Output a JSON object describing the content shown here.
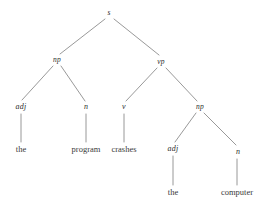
{
  "figure": {
    "kind": "constituency-syntax-tree",
    "sentence": "the program crashes the computer",
    "background_color": "#ffffff",
    "edge_color": "#8d8d8d",
    "label_color": "#2b2b2b",
    "leaf_color": "#3a3a3a"
  },
  "nodes": {
    "root": {
      "label": "s",
      "x": 109,
      "y": 13
    },
    "np_subject": {
      "label": "np",
      "x": 57,
      "y": 60
    },
    "vp": {
      "label": "vp",
      "x": 161,
      "y": 62
    },
    "adj_subject": {
      "label": "adj",
      "x": 21,
      "y": 107
    },
    "n_subject": {
      "label": "n",
      "x": 86,
      "y": 107
    },
    "v": {
      "label": "v",
      "x": 124,
      "y": 107
    },
    "np_object": {
      "label": "np",
      "x": 200,
      "y": 107
    },
    "adj_object": {
      "label": "adj",
      "x": 173,
      "y": 149
    },
    "n_object": {
      "label": "n",
      "x": 238,
      "y": 152
    }
  },
  "leaves": {
    "the_subject": {
      "word": "the",
      "x": 21,
      "y": 149
    },
    "program": {
      "word": "program",
      "x": 86,
      "y": 149
    },
    "crashes": {
      "word": "crashes",
      "x": 124,
      "y": 149
    },
    "the_object": {
      "word": "the",
      "x": 173,
      "y": 192
    },
    "computer": {
      "word": "computer",
      "x": 237,
      "y": 192
    }
  },
  "edges": [
    {
      "from": "root",
      "to": "np_subject",
      "x1": 105,
      "y1": 19,
      "x2": 60,
      "y2": 54
    },
    {
      "from": "root",
      "to": "vp",
      "x1": 114,
      "y1": 19,
      "x2": 159,
      "y2": 55
    },
    {
      "from": "np_subject",
      "to": "adj_subject",
      "x1": 53,
      "y1": 66,
      "x2": 22,
      "y2": 100
    },
    {
      "from": "np_subject",
      "to": "n_subject",
      "x1": 61,
      "y1": 66,
      "x2": 85,
      "y2": 101
    },
    {
      "from": "vp",
      "to": "v",
      "x1": 157,
      "y1": 68,
      "x2": 126,
      "y2": 101
    },
    {
      "from": "vp",
      "to": "np_object",
      "x1": 166,
      "y1": 68,
      "x2": 197,
      "y2": 101
    },
    {
      "from": "adj_subject",
      "to": "the_subject",
      "x1": 21,
      "y1": 114,
      "x2": 21,
      "y2": 142
    },
    {
      "from": "n_subject",
      "to": "program",
      "x1": 86,
      "y1": 114,
      "x2": 86,
      "y2": 142
    },
    {
      "from": "v",
      "to": "crashes",
      "x1": 124,
      "y1": 114,
      "x2": 124,
      "y2": 142
    },
    {
      "from": "np_object",
      "to": "adj_object",
      "x1": 196,
      "y1": 113,
      "x2": 175,
      "y2": 142
    },
    {
      "from": "np_object",
      "to": "n_object",
      "x1": 204,
      "y1": 113,
      "x2": 236,
      "y2": 145
    },
    {
      "from": "adj_object",
      "to": "the_object",
      "x1": 173,
      "y1": 156,
      "x2": 173,
      "y2": 185
    },
    {
      "from": "n_object",
      "to": "computer",
      "x1": 237,
      "y1": 159,
      "x2": 237,
      "y2": 185
    }
  ]
}
